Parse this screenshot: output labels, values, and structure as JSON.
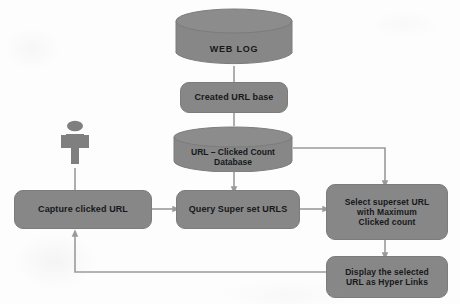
{
  "diagram": {
    "palette": {
      "node_fill": "#878787",
      "node_stroke": "#7c7c7c",
      "connector": "#9a9a9a",
      "text": "#16181a",
      "background": "#fdfdfd",
      "actor_fill": "#7f7f7f"
    },
    "nodes": [
      {
        "id": "web-log",
        "label": "WEB LOG",
        "shape": "cylinder"
      },
      {
        "id": "created-url-base",
        "label": "Created URL base",
        "shape": "rounded-rect"
      },
      {
        "id": "url-click-db",
        "label": "URL – Clicked Count\nDatabase",
        "shape": "cylinder"
      },
      {
        "id": "capture-url",
        "label": "Capture clicked URL",
        "shape": "rounded-rect"
      },
      {
        "id": "query-superset",
        "label": "Query Super set URLS",
        "shape": "rounded-rect"
      },
      {
        "id": "select-max",
        "label": "Select superset URL\nwith Maximum\nClicked count",
        "shape": "rounded-rect"
      },
      {
        "id": "display-links",
        "label": "Display the selected\nURL as Hyper Links",
        "shape": "rounded-rect"
      },
      {
        "id": "user-actor",
        "label": "",
        "shape": "actor"
      }
    ],
    "edges": [
      {
        "from": "web-log",
        "to": "created-url-base",
        "arrow": false
      },
      {
        "from": "created-url-base",
        "to": "url-click-db",
        "arrow": false
      },
      {
        "from": "url-click-db",
        "to": "query-superset",
        "arrow": true
      },
      {
        "from": "url-click-db",
        "to": "select-max",
        "arrow": true
      },
      {
        "from": "user-actor",
        "to": "capture-url",
        "arrow": false
      },
      {
        "from": "capture-url",
        "to": "query-superset",
        "arrow": true
      },
      {
        "from": "query-superset",
        "to": "select-max",
        "arrow": true
      },
      {
        "from": "select-max",
        "to": "display-links",
        "arrow": true
      },
      {
        "from": "display-links",
        "to": "capture-url",
        "arrow": true
      }
    ]
  }
}
